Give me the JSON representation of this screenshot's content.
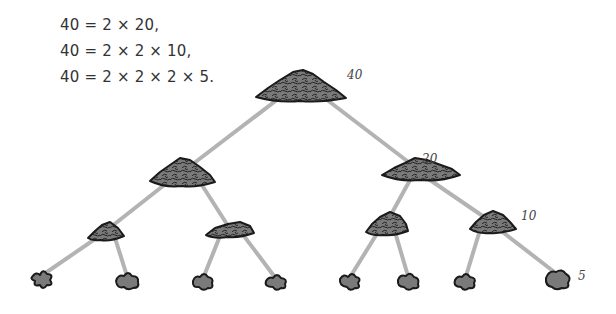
{
  "equations": [
    "40 = 2 × 20,",
    "40 = 2 × 2 × 10,",
    "40 = 2 × 2 × 2 × 5."
  ],
  "tree": {
    "root": {
      "value": "40",
      "label": "40"
    },
    "level1": [
      {
        "value": "2",
        "label": ""
      },
      {
        "value": "20",
        "label": "20"
      }
    ],
    "level2": [
      {
        "value": "",
        "label": ""
      },
      {
        "value": "",
        "label": ""
      },
      {
        "value": "2",
        "label": ""
      },
      {
        "value": "10",
        "label": "10"
      }
    ],
    "level3_leaf_labels": [
      "",
      "",
      "",
      "",
      "",
      "",
      "",
      "5"
    ]
  },
  "colors": {
    "branch": "#b3b3b3",
    "pile_fill": "#7a7a7a",
    "pile_outline": "#1a1a1a",
    "text": "#333333"
  }
}
